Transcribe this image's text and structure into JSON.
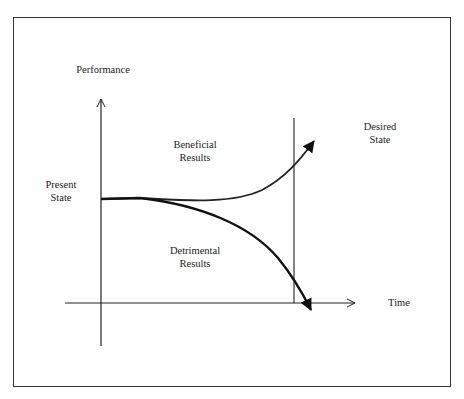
{
  "labels": {
    "y_axis": "Performance",
    "x_axis": "Time",
    "present_state": [
      "Present",
      "State"
    ],
    "desired_state": [
      "Desired",
      "State"
    ],
    "beneficial": [
      "Beneficial",
      "Results"
    ],
    "detrimental": [
      "Detrimental",
      "Results"
    ]
  },
  "colors": {
    "line": "#222222",
    "frame": "#333333",
    "background": "#ffffff"
  }
}
